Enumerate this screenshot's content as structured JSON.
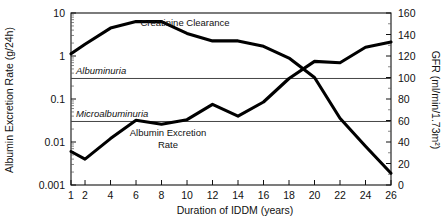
{
  "chart_data": {
    "type": "line",
    "title": "",
    "xlabel": "Duration of IDDM (years)",
    "ylabel": "Albumin Excretion Rate (g/24h)",
    "y2label": "GFR (ml/min/1.73m²)",
    "x": [
      1,
      2,
      4,
      6,
      8,
      10,
      12,
      14,
      16,
      18,
      20,
      22,
      24,
      26
    ],
    "xticklabels": [
      "1",
      "2",
      "4",
      "6",
      "8",
      "10",
      "12",
      "14",
      "16",
      "18",
      "20",
      "22",
      "24",
      "26"
    ],
    "xlim": [
      1,
      26
    ],
    "ylim": [
      0.001,
      10
    ],
    "yscale": "log",
    "yticklabels": [
      "10",
      "1",
      "0.1",
      "0.01",
      "0.001"
    ],
    "ytickvalues": [
      10,
      1,
      0.1,
      0.01,
      0.001
    ],
    "y2lim": [
      0,
      160
    ],
    "y2ticklabels": [
      "160",
      "140",
      "120",
      "100",
      "80",
      "60",
      "40",
      "20",
      "0"
    ],
    "y2tickvalues": [
      160,
      140,
      120,
      100,
      80,
      60,
      40,
      20,
      0
    ],
    "grid": false,
    "legend": "inline-annotations",
    "series": [
      {
        "name": "Albumin Excretion Rate",
        "axis": "left",
        "units": "g/24h",
        "label": "Albumin Excretion",
        "label_line2": "Rate",
        "values": [
          0.006,
          0.004,
          0.012,
          0.032,
          0.026,
          0.033,
          0.075,
          0.04,
          0.085,
          0.3,
          0.75,
          0.7,
          1.6,
          2.1
        ]
      },
      {
        "name": "Creatinine Clearance",
        "axis": "right",
        "units": "ml/min/1.73m²",
        "label": "Creatinine Clearance",
        "values": [
          122,
          131,
          146,
          152,
          152,
          141,
          134,
          134,
          129,
          118,
          100,
          62,
          36,
          11
        ]
      }
    ],
    "thresholds": [
      {
        "name": "Albuminuria",
        "label": "Albuminuria",
        "value": 0.3,
        "axis": "left"
      },
      {
        "name": "Microalbuminuria",
        "label": "Microalbuminuria",
        "value": 0.03,
        "axis": "left"
      }
    ]
  }
}
